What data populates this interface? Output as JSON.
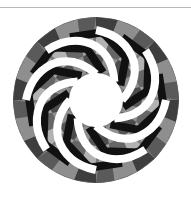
{
  "figure": {
    "type": "rosette-pattern",
    "symmetry": 8,
    "center": [
      96,
      100
    ],
    "outer_radius": 83,
    "inner_radius": 27,
    "colors": {
      "background": "#ffffff",
      "rule": "#b8b8b8",
      "base_gray": "#7a7a7a",
      "mid_gray": "#8f8f8f",
      "dark_gray": "#4a4a4a",
      "light_gray": "#b4b4b4",
      "black_band": "#111111",
      "white_band": "#ffffff"
    }
  }
}
